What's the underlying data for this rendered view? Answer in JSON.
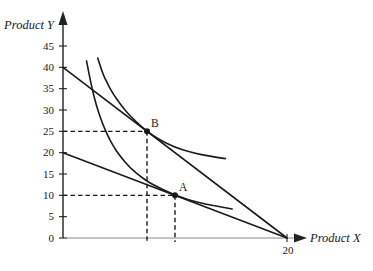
{
  "figure": {
    "background": "#ffffff",
    "curve_color": "#1a1a1a",
    "y_axis_color": "#222222",
    "x_axis_color": "#8a8a8a",
    "tick_color": "#222222",
    "guide_color": "#1a1a1a",
    "text_color": "#1a1a1a"
  },
  "chart_data": {
    "type": "line",
    "title": "",
    "xlabel": "Product X",
    "ylabel": "Product Y",
    "xlim": [
      0,
      21.5
    ],
    "ylim": [
      0,
      47
    ],
    "grid": false,
    "legend": false,
    "x_ticks": [
      20
    ],
    "y_ticks": [
      0,
      5,
      10,
      15,
      20,
      25,
      30,
      35,
      40,
      45
    ],
    "series": [
      {
        "name": "budget-line-high",
        "kind": "straight",
        "points": [
          [
            0,
            40
          ],
          [
            20,
            0
          ]
        ]
      },
      {
        "name": "budget-line-low",
        "kind": "straight",
        "points": [
          [
            0,
            20
          ],
          [
            20,
            0
          ]
        ]
      },
      {
        "name": "indifference-curve-high",
        "kind": "curve",
        "points": [
          [
            3.1,
            42.2
          ],
          [
            3.5,
            38.8
          ],
          [
            4,
            36.0
          ],
          [
            4.5,
            33.7
          ],
          [
            5,
            31.8
          ],
          [
            5.5,
            30.1
          ],
          [
            6,
            28.6
          ],
          [
            7,
            26.1
          ],
          [
            7.5,
            25.0
          ],
          [
            8.5,
            23.2
          ],
          [
            10,
            21.2
          ],
          [
            11.5,
            20.0
          ],
          [
            13,
            19.2
          ],
          [
            14.5,
            18.6
          ]
        ]
      },
      {
        "name": "indifference-curve-low",
        "kind": "curve",
        "points": [
          [
            2.1,
            41.5
          ],
          [
            2.5,
            36.0
          ],
          [
            3,
            30.8
          ],
          [
            3.5,
            27.0
          ],
          [
            4,
            23.9
          ],
          [
            4.5,
            21.5
          ],
          [
            5,
            19.5
          ],
          [
            6,
            16.4
          ],
          [
            7,
            14.2
          ],
          [
            8,
            12.5
          ],
          [
            10,
            10.0
          ],
          [
            12,
            8.3
          ],
          [
            15.1,
            6.8
          ]
        ]
      }
    ],
    "points": [
      {
        "label": "B",
        "x": 7.5,
        "y": 25,
        "guides": true
      },
      {
        "label": "A",
        "x": 10,
        "y": 10,
        "guides": true
      }
    ]
  }
}
